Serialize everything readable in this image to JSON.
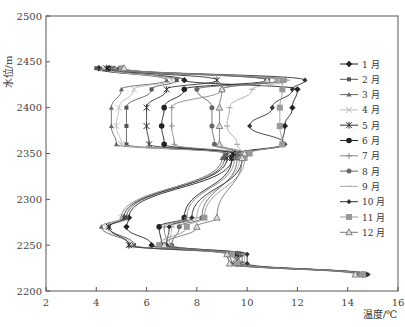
{
  "chart_data": {
    "type": "line",
    "title": "",
    "xlabel": "温度/℃",
    "ylabel": "水位/m",
    "xlim": [
      2,
      16
    ],
    "ylim": [
      2200,
      2500
    ],
    "xticks": [
      2,
      4,
      6,
      8,
      10,
      12,
      14,
      16
    ],
    "yticks": [
      2200,
      2250,
      2300,
      2350,
      2400,
      2450,
      2500
    ],
    "grid": false,
    "legend_position": "right",
    "y": [
      2443,
      2430,
      2420,
      2400,
      2380,
      2360,
      2350,
      2345,
      2280,
      2270,
      2250,
      2240,
      2230,
      2218
    ],
    "series": [
      {
        "name": "1 月",
        "marker": "diamond-filled",
        "color": "#222222",
        "values": [
          4.1,
          7.5,
          12.0,
          11.8,
          11.5,
          11.4,
          9.7,
          9.4,
          5.3,
          5.2,
          6.2,
          9.5,
          9.6,
          14.6
        ]
      },
      {
        "name": "2 月",
        "marker": "square-small",
        "color": "#555555",
        "values": [
          4.0,
          7.2,
          6.2,
          5.2,
          5.2,
          5.2,
          9.2,
          9.1,
          5.2,
          4.5,
          5.5,
          9.3,
          9.4,
          14.5
        ]
      },
      {
        "name": "3 月",
        "marker": "triangle-small",
        "color": "#666666",
        "values": [
          4.2,
          6.8,
          5.0,
          4.6,
          4.6,
          4.8,
          9.1,
          9.0,
          5.0,
          4.2,
          5.3,
          9.2,
          9.3,
          14.4
        ]
      },
      {
        "name": "4 月",
        "marker": "x-light",
        "color": "#bbbbbb",
        "values": [
          4.3,
          7.0,
          5.5,
          4.9,
          4.8,
          5.0,
          9.3,
          9.2,
          5.0,
          4.4,
          5.4,
          9.4,
          9.5,
          14.5
        ]
      },
      {
        "name": "5 月",
        "marker": "asterisk",
        "color": "#333333",
        "values": [
          4.4,
          8.8,
          6.8,
          6.0,
          6.0,
          6.1,
          9.4,
          9.2,
          5.1,
          4.5,
          5.3,
          9.6,
          9.6,
          14.6
        ]
      },
      {
        "name": "6 月",
        "marker": "circle-filled",
        "color": "#222222",
        "values": [
          4.5,
          10.8,
          7.5,
          6.7,
          6.6,
          6.7,
          9.5,
          9.4,
          7.5,
          6.5,
          6.6,
          9.7,
          9.6,
          14.7
        ]
      },
      {
        "name": "7 月",
        "marker": "plus",
        "color": "#888888",
        "values": [
          4.6,
          11.2,
          9.0,
          7.0,
          7.0,
          7.1,
          9.6,
          9.5,
          7.6,
          6.7,
          6.8,
          9.7,
          9.7,
          14.7
        ]
      },
      {
        "name": "8 月",
        "marker": "circle-gray",
        "color": "#666666",
        "values": [
          4.7,
          11.5,
          8.0,
          8.6,
          8.6,
          8.7,
          9.7,
          9.6,
          8.2,
          7.3,
          7.0,
          9.8,
          9.8,
          14.7
        ]
      },
      {
        "name": "9 月",
        "marker": "dash-light",
        "color": "#aaaaaa",
        "values": [
          4.8,
          11.6,
          10.2,
          9.3,
          9.2,
          9.6,
          9.8,
          9.7,
          8.0,
          7.0,
          6.9,
          9.9,
          9.9,
          14.8
        ]
      },
      {
        "name": "10 月",
        "marker": "diamond-small",
        "color": "#333333",
        "values": [
          4.9,
          12.3,
          11.8,
          11.0,
          10.1,
          11.5,
          10.0,
          9.8,
          7.8,
          6.9,
          6.8,
          10.0,
          10.0,
          14.8
        ]
      },
      {
        "name": "11 月",
        "marker": "square-gray",
        "color": "#999999",
        "values": [
          5.0,
          11.4,
          11.4,
          11.3,
          11.3,
          11.4,
          10.1,
          9.9,
          8.3,
          7.6,
          6.5,
          9.4,
          9.6,
          14.6
        ]
      },
      {
        "name": "12 月",
        "marker": "triangle-open",
        "color": "#777777",
        "values": [
          5.1,
          10.8,
          9.0,
          8.9,
          8.9,
          8.9,
          9.9,
          9.8,
          8.8,
          8.0,
          6.7,
          9.2,
          9.3,
          14.3
        ]
      }
    ]
  }
}
